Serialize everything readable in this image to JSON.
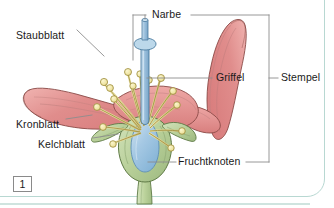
{
  "figure": {
    "number": "1",
    "language": "de"
  },
  "labels": {
    "narbe": "Narbe",
    "griffel": "Griffel",
    "stempel": "Stempel",
    "staubblatt": "Staubblatt",
    "kronblatt": "Kronblatt",
    "kelchblatt": "Kelchblatt",
    "fruchtknoten": "Fruchtknoten"
  },
  "label_positions": {
    "narbe": {
      "x": 152,
      "y": 10
    },
    "griffel": {
      "x": 215,
      "y": 78
    },
    "stempel": {
      "x": 281,
      "y": 78
    },
    "staubblatt": {
      "x": 17,
      "y": 30
    },
    "kronblatt": {
      "x": 17,
      "y": 119
    },
    "kelchblatt": {
      "x": 38,
      "y": 138
    },
    "fruchtknoten": {
      "x": 178,
      "y": 157
    }
  },
  "colors": {
    "petal_fill": "#e38c8c",
    "petal_fill_light": "#ecadad",
    "petal_stroke": "#8a4a46",
    "stamen_filament": "#d9cf8a",
    "stamen_stroke": "#9a8a3a",
    "anther_fill": "#f2eab0",
    "style_fill": "#9ec3de",
    "style_stroke": "#4a7a9e",
    "ovary_fill": "#9ec5e2",
    "sepal_fill": "#b7cf97",
    "sepal_stroke": "#5f7a46",
    "leader_line": "#8d8d8d",
    "frame": "#b8d8d2",
    "text": "#1a1a1a",
    "background": "#ffffff"
  },
  "parts": [
    {
      "name": "Narbe",
      "english": "stigma",
      "color": "#9ec3de"
    },
    {
      "name": "Griffel",
      "english": "style",
      "color": "#9ec3de"
    },
    {
      "name": "Fruchtknoten",
      "english": "ovary",
      "color": "#9ec5e2"
    },
    {
      "name": "Stempel",
      "english": "pistil",
      "color": "#9ec3de"
    },
    {
      "name": "Staubblatt",
      "english": "stamen",
      "color": "#d9cf8a"
    },
    {
      "name": "Kronblatt",
      "english": "petal",
      "color": "#e38c8c"
    },
    {
      "name": "Kelchblatt",
      "english": "sepal",
      "color": "#b7cf97"
    }
  ]
}
